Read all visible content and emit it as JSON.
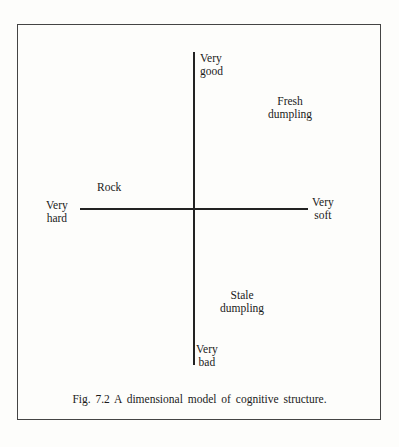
{
  "figure": {
    "caption": "Fig. 7.2   A dimensional model of cognitive structure.",
    "vertical_axis": {
      "top_label": "Very\ngood",
      "bottom_label": "Very\nbad"
    },
    "horizontal_axis": {
      "left_label": "Very\nhard",
      "right_label": "Very\nsoft"
    },
    "points": [
      {
        "label": "Fresh\ndumpling"
      },
      {
        "label": "Rock"
      },
      {
        "label": "Stale\ndumpling"
      }
    ]
  }
}
